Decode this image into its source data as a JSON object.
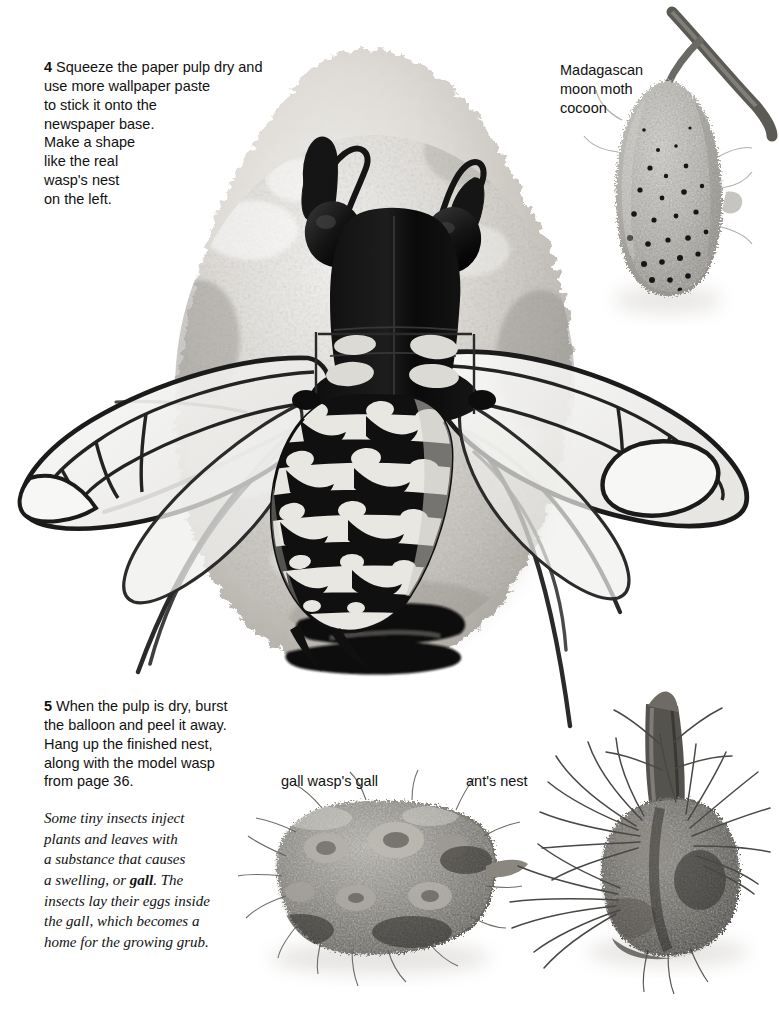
{
  "page": {
    "background_color": "#ffffff",
    "text_color": "#111111",
    "kind": "illustrated craft instruction page about wasp nests and insect homes"
  },
  "steps": [
    {
      "number": "4",
      "body": "Squeeze the paper pulp dry and\nuse more wallpaper paste\nto stick it onto the\nnewspaper base.\nMake a shape\nlike the real\nwasp's nest\non the left."
    },
    {
      "number": "5",
      "body": "When the pulp is dry, burst\nthe balloon and peel it away.\nHang up the finished nest,\nalong with the model wasp\nfrom page 36."
    }
  ],
  "fact_box": {
    "line1": "Some tiny insects inject",
    "line2": "plants and leaves with",
    "line3": "a substance that causes",
    "line4_pre": "a swelling, or ",
    "line4_bold": "gall",
    "line4_post": ". The",
    "line5": "insects lay their eggs inside",
    "line6": "the gall, which becomes a",
    "line7": "home for the growing grub."
  },
  "captions": {
    "cocoon": "Madagascan\nmoon moth\ncocoon",
    "gall": "gall wasp's gall",
    "ant_nest": "ant's nest"
  },
  "photos": [
    {
      "name": "wasp-nest-photo",
      "description": "rough grey-white papier mache wasp nest ball with dark entrance slot at the bottom"
    },
    {
      "name": "model-wasp-photo",
      "description": "black and white card model wasp with two antennae, two round eyes, two pairs of translucent veined wings, six thin legs and a striped spotted abdomen"
    },
    {
      "name": "moon-moth-cocoon-photo",
      "description": "grey mesh teardrop cocoon with dark perforations hanging from a twig"
    },
    {
      "name": "gall-wasp-gall-photo",
      "description": "lumpy hairy brown-grey gall cluster"
    },
    {
      "name": "ants-nest-photo",
      "description": "dark rounded ant nest built around a stem with spiky pine needles"
    }
  ],
  "colors": {
    "nest_light": "#e8e6e2",
    "nest_mid": "#c9c6c0",
    "nest_dark": "#9b9891",
    "wasp_black": "#141414",
    "wing_fill": "#f2f2f0",
    "cocoon_grey": "#b4b2ad",
    "gall_grey": "#8e8b85",
    "ant_nest_grey": "#6f6d69"
  }
}
